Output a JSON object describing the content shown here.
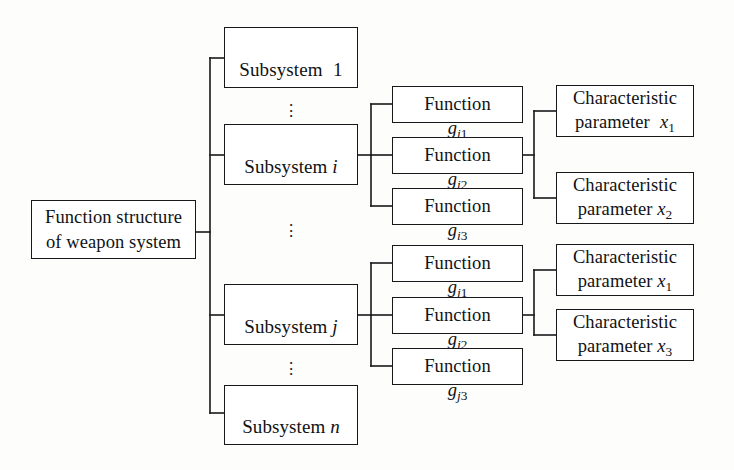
{
  "diagram": {
    "type": "tree-diagram",
    "background": "#fdfdfc",
    "line_color": "#16181a",
    "box_fill": "#ffffff"
  },
  "root": {
    "label": "Function structure\nof weapon system"
  },
  "subsystems": [
    {
      "id": "sub-1",
      "prefix": "Subsystem",
      "index": "1",
      "index_italic": false,
      "spaced": true
    },
    {
      "id": "sub-i",
      "prefix": "Subsystem",
      "index": "i",
      "index_italic": true,
      "spaced": false
    },
    {
      "id": "sub-j",
      "prefix": "Subsystem",
      "index": "j",
      "index_italic": true,
      "spaced": false
    },
    {
      "id": "sub-n",
      "prefix": "Subsystem",
      "index": "n",
      "index_italic": true,
      "spaced": false
    }
  ],
  "functions": [
    {
      "id": "fn-i1",
      "prefix": "Function",
      "symbol": "g",
      "sub_letter": "i",
      "sub_number": "1"
    },
    {
      "id": "fn-i2",
      "prefix": "Function",
      "symbol": "g",
      "sub_letter": "i",
      "sub_number": "2"
    },
    {
      "id": "fn-i3",
      "prefix": "Function",
      "symbol": "g",
      "sub_letter": "i",
      "sub_number": "3"
    },
    {
      "id": "fn-j1",
      "prefix": "Function",
      "symbol": "g",
      "sub_letter": "j",
      "sub_number": "1"
    },
    {
      "id": "fn-j2",
      "prefix": "Function",
      "symbol": "g",
      "sub_letter": "j",
      "sub_number": "2"
    },
    {
      "id": "fn-j3",
      "prefix": "Function",
      "symbol": "g",
      "sub_letter": "j",
      "sub_number": "3"
    }
  ],
  "characteristics": [
    {
      "id": "char-x1-top",
      "line1": "Characteristic",
      "line2": "parameter",
      "symbol": "x",
      "index": "1",
      "extra_space": true
    },
    {
      "id": "char-x2",
      "line1": "Characteristic",
      "line2": "parameter",
      "symbol": "x",
      "index": "2",
      "extra_space": false
    },
    {
      "id": "char-x1-bottom",
      "line1": "Characteristic",
      "line2": "parameter",
      "symbol": "x",
      "index": "1",
      "extra_space": false
    },
    {
      "id": "char-x3",
      "line1": "Characteristic",
      "line2": "parameter",
      "symbol": "x",
      "index": "3",
      "extra_space": false
    }
  ],
  "ellipses": [
    {
      "id": "ellipsis-sub-1-i",
      "glyph": "⋮"
    },
    {
      "id": "ellipsis-sub-i-j",
      "glyph": "⋮"
    },
    {
      "id": "ellipsis-sub-j-n",
      "glyph": "⋮"
    }
  ]
}
